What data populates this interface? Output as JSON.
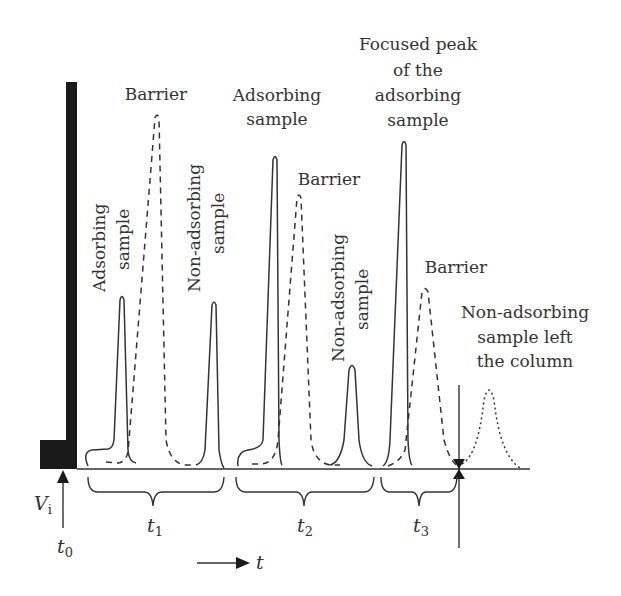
{
  "labels": {
    "barrier_1": "Barrier",
    "adsorbing_sample_1_line1": "Adsorbing",
    "adsorbing_sample_1_line2": "sample",
    "non_adsorbing_1_line1": "Non-adsorbing",
    "non_adsorbing_1_line2": "sample",
    "adsorbing_sample_2_line1": "Adsorbing",
    "adsorbing_sample_2_line2": "sample",
    "barrier_2": "Barrier",
    "non_adsorbing_2_line1": "Non-adsorbing",
    "non_adsorbing_2_line2": "sample",
    "focused_peak_line1": "Focused peak",
    "focused_peak_line2": "of the",
    "focused_peak_line3": "adsorbing",
    "focused_peak_line4": "sample",
    "barrier_3": "Barrier",
    "left_column_line1": "Non-adsorbing",
    "left_column_line2": "sample left",
    "left_column_line3": "the column"
  },
  "axis": {
    "vi_main": "V",
    "vi_sub": "i",
    "t0_main": "t",
    "t0_sub": "0",
    "t1_main": "t",
    "t1_sub": "1",
    "t2_main": "t",
    "t2_sub": "2",
    "t3_main": "t",
    "t3_sub": "3",
    "time_label": "t"
  },
  "colors": {
    "line": "#333333",
    "wall": "#1a1a1a",
    "background": "#ffffff"
  }
}
